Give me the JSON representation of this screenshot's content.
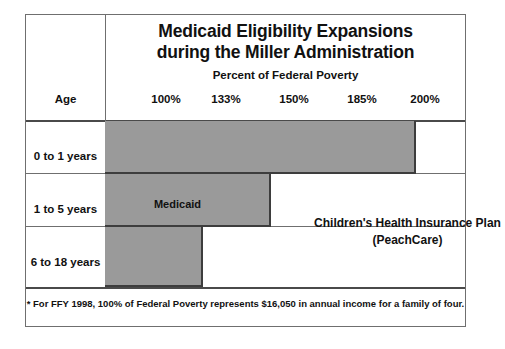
{
  "chart_data": {
    "type": "bar",
    "title": "Medicaid Eligibility Expansions during the Miller Administration",
    "title_line1": "Medicaid Eligibility Expansions",
    "title_line2": "during the Miller Administration",
    "subtitle": "Percent of Federal Poverty",
    "xlabel": "Percent of Federal Poverty",
    "ylabel": "Age",
    "orientation": "horizontal",
    "xlim": [
      0,
      210
    ],
    "x_tick_labels": [
      "100%",
      "133%",
      "150%",
      "185%",
      "200%"
    ],
    "x_tick_values": [
      100,
      133,
      150,
      185,
      200
    ],
    "categories": [
      "0 to 1 years",
      "1 to 5 years",
      "6 to 18 years"
    ],
    "series": [
      {
        "name": "Medicaid",
        "values": [
          185,
          133,
          100
        ],
        "color": "#9a9a9a"
      },
      {
        "name": "Children's Health Insurance Plan (PeachCare)",
        "values": [
          200,
          200,
          200
        ],
        "color": "#ffffff"
      }
    ],
    "annotations": [
      {
        "text": "Medicaid",
        "region": "gray-bars"
      },
      {
        "text": "Children's Health Insurance Plan",
        "region": "white-bars"
      },
      {
        "text": "(PeachCare)",
        "region": "white-bars"
      }
    ],
    "footnote": "* For FFY 1998, 100% of Federal Poverty represents $16,050 in annual income for a family of four.",
    "grid": false,
    "legend": "inline-annotations"
  },
  "header": {
    "age_column_label": "Age",
    "percent_headers": [
      {
        "label": "100%",
        "left": 118
      },
      {
        "label": "133%",
        "left": 178
      },
      {
        "label": "150%",
        "left": 246
      },
      {
        "label": "185%",
        "left": 314
      },
      {
        "label": "200%",
        "left": 377
      }
    ]
  },
  "rows": [
    {
      "age": "0 to 1 years",
      "label_top": 135,
      "rule_top": 158,
      "bar_width": 311,
      "bar_height": 53
    },
    {
      "age": "1 to 5 years",
      "label_top": 188,
      "rule_top": 211,
      "bar_width": 166,
      "bar_height": 53
    },
    {
      "age": "6 to 18 years",
      "label_top": 241,
      "rule_top": 272,
      "bar_width": 98,
      "bar_height": 60
    }
  ],
  "labels": {
    "medicaid": "Medicaid",
    "chip_line1": "Children's Health Insurance Plan",
    "chip_line2": "(PeachCare)"
  },
  "footnote": {
    "text": "*  For FFY 1998, 100% of Federal Poverty represents $16,050 in annual income for a family of four."
  },
  "colors": {
    "medicaid_fill": "#9a9a9a",
    "bar_border": "#3d3d3d",
    "frame_border": "#6f6f6f",
    "rule_strong": "#4a4a4a",
    "text": "#111111",
    "background": "#ffffff"
  }
}
